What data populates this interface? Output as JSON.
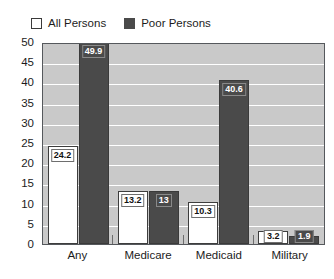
{
  "legend": {
    "items": [
      {
        "label": "All Persons",
        "swatch": "white-square-icon",
        "color": "#ffffff"
      },
      {
        "label": "Poor Persons",
        "swatch": "dark-square-icon",
        "color": "#4a4a4a"
      }
    ]
  },
  "axis": {
    "y_ticks": [
      "50",
      "45",
      "40",
      "35",
      "30",
      "25",
      "20",
      "15",
      "10",
      "5",
      "0"
    ]
  },
  "chart_data": {
    "type": "bar",
    "title": "",
    "subtitle": "",
    "xlabel": "",
    "ylabel": "",
    "ylim": [
      0,
      50
    ],
    "ytick_step": 5,
    "grid": true,
    "legend_position": "top-left",
    "categories": [
      "Any",
      "Medicare",
      "Medicaid",
      "Military"
    ],
    "series": [
      {
        "name": "All Persons",
        "color": "#ffffff",
        "values": [
          24.2,
          13.2,
          10.3,
          3.2
        ],
        "labels": [
          "24.2",
          "13.2",
          "10.3",
          "3.2"
        ]
      },
      {
        "name": "Poor Persons",
        "color": "#4a4a4a",
        "values": [
          49.9,
          13,
          40.6,
          1.9
        ],
        "labels": [
          "49.9",
          "13",
          "40.6",
          "1.9"
        ]
      }
    ]
  }
}
